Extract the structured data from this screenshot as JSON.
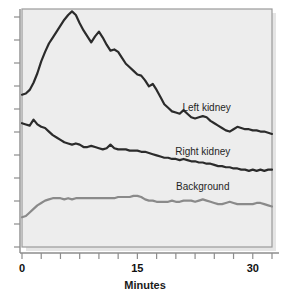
{
  "chart_data": {
    "type": "line",
    "title": "",
    "xlabel": "Minutes",
    "ylabel": "",
    "xlim": [
      0,
      32.5
    ],
    "ylim": [
      0,
      100
    ],
    "grid": false,
    "legend_position": "inline-right",
    "x_ticks": [
      0,
      2.5,
      5,
      7.5,
      10,
      12.5,
      15,
      17.5,
      20,
      22.5,
      25,
      27.5,
      30,
      32.5
    ],
    "x_tick_labels": [
      "0",
      "",
      "",
      "",
      "",
      "",
      "15",
      "",
      "",
      "",
      "",
      "",
      "30",
      ""
    ],
    "y_ticks_count": 11,
    "y_tick_labels": [
      "",
      "",
      "",
      "",
      "",
      "",
      "",
      "",
      "",
      "",
      ""
    ],
    "annotations": [
      {
        "text": "Left kidney",
        "x": 24.0,
        "y": 57.0
      },
      {
        "text": "Right kidney",
        "x": 23.5,
        "y": 38.5
      },
      {
        "text": "Background",
        "x": 23.5,
        "y": 24.0
      }
    ],
    "series": [
      {
        "name": "Left kidney",
        "color": "#2b2b2b",
        "x": [
          0.0,
          0.5,
          1.0,
          1.5,
          2.0,
          2.5,
          3.0,
          3.5,
          4.0,
          4.5,
          5.0,
          5.5,
          6.0,
          6.5,
          7.0,
          7.5,
          8.0,
          8.5,
          9.0,
          9.5,
          10.0,
          10.5,
          11.0,
          11.5,
          12.0,
          12.5,
          13.0,
          13.5,
          14.0,
          14.5,
          15.0,
          15.5,
          16.0,
          16.5,
          17.0,
          17.5,
          18.0,
          18.5,
          19.0,
          19.5,
          20.0,
          20.5,
          21.0,
          21.5,
          22.0,
          22.5,
          23.0,
          23.5,
          24.0,
          24.5,
          25.0,
          25.5,
          26.0,
          26.5,
          27.0,
          27.5,
          28.0,
          28.5,
          29.0,
          29.5,
          30.0,
          30.5,
          31.0,
          31.5,
          32.0,
          32.5
        ],
        "y": [
          64.0,
          64.5,
          66.0,
          69.0,
          73.0,
          78.0,
          82.0,
          85.5,
          88.0,
          90.5,
          93.0,
          95.5,
          97.5,
          99.0,
          97.5,
          94.0,
          91.0,
          88.5,
          86.0,
          88.5,
          90.5,
          88.0,
          85.0,
          82.5,
          83.0,
          82.0,
          79.5,
          77.0,
          75.5,
          74.0,
          72.5,
          72.0,
          70.0,
          67.5,
          68.5,
          66.0,
          63.0,
          60.0,
          58.5,
          57.0,
          56.5,
          56.0,
          57.5,
          56.0,
          54.5,
          54.0,
          54.5,
          55.0,
          54.5,
          53.0,
          52.0,
          51.0,
          50.0,
          49.0,
          48.5,
          49.5,
          50.5,
          50.0,
          49.5,
          49.5,
          49.0,
          49.0,
          48.5,
          48.5,
          48.0,
          47.5
        ]
      },
      {
        "name": "Right kidney",
        "color": "#2b2b2b",
        "x": [
          0.0,
          0.5,
          1.0,
          1.5,
          2.0,
          2.5,
          3.0,
          3.5,
          4.0,
          4.5,
          5.0,
          5.5,
          6.0,
          6.5,
          7.0,
          7.5,
          8.0,
          8.5,
          9.0,
          9.5,
          10.0,
          10.5,
          11.0,
          11.5,
          12.0,
          12.5,
          13.0,
          13.5,
          14.0,
          14.5,
          15.0,
          15.5,
          16.0,
          16.5,
          17.0,
          17.5,
          18.0,
          18.5,
          19.0,
          19.5,
          20.0,
          20.5,
          21.0,
          21.5,
          22.0,
          22.5,
          23.0,
          23.5,
          24.0,
          24.5,
          25.0,
          25.5,
          26.0,
          26.5,
          27.0,
          27.5,
          28.0,
          28.5,
          29.0,
          29.5,
          30.0,
          30.5,
          31.0,
          31.5,
          32.0,
          32.5
        ],
        "y": [
          52.0,
          51.5,
          51.0,
          53.5,
          51.5,
          50.5,
          50.0,
          48.5,
          47.0,
          46.0,
          45.0,
          44.0,
          43.5,
          43.0,
          43.5,
          43.0,
          42.0,
          42.0,
          42.5,
          42.0,
          41.5,
          41.0,
          41.5,
          43.0,
          41.5,
          41.0,
          41.0,
          41.0,
          40.5,
          40.5,
          40.5,
          40.0,
          40.0,
          39.5,
          39.0,
          38.5,
          38.0,
          37.5,
          37.5,
          37.0,
          37.0,
          36.5,
          37.0,
          36.5,
          36.0,
          36.0,
          35.5,
          35.5,
          35.0,
          35.0,
          34.5,
          34.0,
          34.0,
          33.5,
          33.5,
          33.0,
          33.0,
          32.5,
          32.5,
          32.0,
          32.5,
          32.0,
          32.5,
          32.0,
          32.5,
          32.5
        ]
      },
      {
        "name": "Background",
        "color": "#8a8a8a",
        "x": [
          0.0,
          0.5,
          1.0,
          1.5,
          2.0,
          2.5,
          3.0,
          3.5,
          4.0,
          4.5,
          5.0,
          5.5,
          6.0,
          6.5,
          7.0,
          7.5,
          8.0,
          8.5,
          9.0,
          9.5,
          10.0,
          10.5,
          11.0,
          11.5,
          12.0,
          12.5,
          13.0,
          13.5,
          14.0,
          14.5,
          15.0,
          15.5,
          16.0,
          16.5,
          17.0,
          17.5,
          18.0,
          18.5,
          19.0,
          19.5,
          20.0,
          20.5,
          21.0,
          21.5,
          22.0,
          22.5,
          23.0,
          23.5,
          24.0,
          24.5,
          25.0,
          25.5,
          26.0,
          26.5,
          27.0,
          27.5,
          28.0,
          28.5,
          29.0,
          29.5,
          30.0,
          30.5,
          31.0,
          31.5,
          32.0,
          32.5
        ],
        "y": [
          12.5,
          13.0,
          14.5,
          16.0,
          17.5,
          18.5,
          19.5,
          20.0,
          20.5,
          20.5,
          20.5,
          20.0,
          20.5,
          20.0,
          20.5,
          20.5,
          20.5,
          20.5,
          20.5,
          20.5,
          20.5,
          20.5,
          20.5,
          20.5,
          20.5,
          21.0,
          21.0,
          21.0,
          21.0,
          21.5,
          21.5,
          21.0,
          20.0,
          19.5,
          19.5,
          19.0,
          19.0,
          19.0,
          19.0,
          19.5,
          19.0,
          19.0,
          19.5,
          19.5,
          19.5,
          19.0,
          19.5,
          20.0,
          19.5,
          19.0,
          18.5,
          18.0,
          18.0,
          18.5,
          19.0,
          18.5,
          18.0,
          18.0,
          18.0,
          18.0,
          18.0,
          18.5,
          18.5,
          18.0,
          17.5,
          17.0
        ]
      }
    ]
  },
  "style": {
    "panel_fill": "#ededed",
    "panel_border": "#9a9a9a",
    "axis_color": "#8d8d8d",
    "page_background": "#ffffff"
  }
}
